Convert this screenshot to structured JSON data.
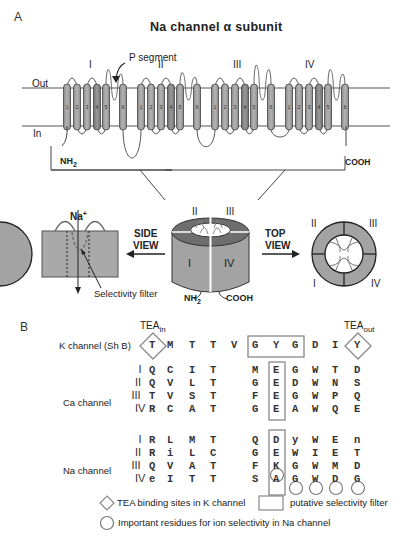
{
  "panel_a": {
    "label": "A",
    "title": "Na channel α subunit",
    "p_segment_label": "P segment",
    "out_label": "Out",
    "in_label": "In",
    "domains": [
      "I",
      "II",
      "III",
      "IV"
    ],
    "helix_numbers": [
      "1",
      "2",
      "3",
      "4",
      "5",
      "6"
    ],
    "nh2_label": "NH",
    "nh2_sub": "2",
    "cooh_label": "COOH",
    "side_view_label_1": "SIDE",
    "side_view_label_2": "VIEW",
    "top_view_label_1": "TOP",
    "top_view_label_2": "VIEW",
    "na_label": "Na",
    "na_sup": "+",
    "selectivity_filter_label": "Selectivity filter",
    "barrel_domains": {
      "top_left": "II",
      "top_right": "III",
      "front_left": "I",
      "front_right": "IV"
    },
    "top_view_domains": {
      "top_left": "II",
      "top_right": "III",
      "bottom_left": "I",
      "bottom_right": "IV"
    }
  },
  "panel_b": {
    "label": "B",
    "tea_in": "TEA",
    "tea_in_sub": "in",
    "tea_out": "TEA",
    "tea_out_sub": "out",
    "k_channel": {
      "name": "K channel (Sh B)",
      "residues": [
        "T",
        "M",
        "T",
        "T",
        "V",
        "G",
        "Y",
        "G",
        "D",
        "I",
        "Y"
      ]
    },
    "ca_channel": {
      "name": "Ca channel",
      "rows": [
        {
          "domain": "I",
          "left": [
            "Q",
            "C",
            "I",
            "T"
          ],
          "right": [
            "M",
            "E",
            "G",
            "W",
            "T",
            "D"
          ]
        },
        {
          "domain": "II",
          "left": [
            "Q",
            "V",
            "L",
            "T"
          ],
          "right": [
            "G",
            "E",
            "D",
            "W",
            "N",
            "S"
          ]
        },
        {
          "domain": "III",
          "left": [
            "T",
            "V",
            "S",
            "T"
          ],
          "right": [
            "F",
            "E",
            "G",
            "W",
            "P",
            "Q"
          ]
        },
        {
          "domain": "IV",
          "left": [
            "R",
            "C",
            "A",
            "T"
          ],
          "right": [
            "G",
            "E",
            "A",
            "W",
            "Q",
            "E"
          ]
        }
      ]
    },
    "na_channel": {
      "name": "Na channel",
      "rows": [
        {
          "domain": "I",
          "left": [
            "R",
            "L",
            "M",
            "T"
          ],
          "right": [
            "Q",
            "D",
            "y",
            "W",
            "E",
            "n"
          ]
        },
        {
          "domain": "II",
          "left": [
            "R",
            "i",
            "L",
            "C"
          ],
          "right": [
            "G",
            "E",
            "W",
            "I",
            "E",
            "T"
          ]
        },
        {
          "domain": "III",
          "left": [
            "Q",
            "V",
            "A",
            "T"
          ],
          "right": [
            "F",
            "K",
            "G",
            "W",
            "M",
            "D"
          ]
        },
        {
          "domain": "IV",
          "left": [
            "e",
            "I",
            "T",
            "T"
          ],
          "right": [
            "S",
            "A",
            "G",
            "W",
            "D",
            "G"
          ]
        }
      ]
    },
    "legend": {
      "diamond": "TEA binding sites in K channel",
      "box": "putative selectivity filter",
      "circle": "Important residues for ion selectivity in Na channel"
    }
  }
}
